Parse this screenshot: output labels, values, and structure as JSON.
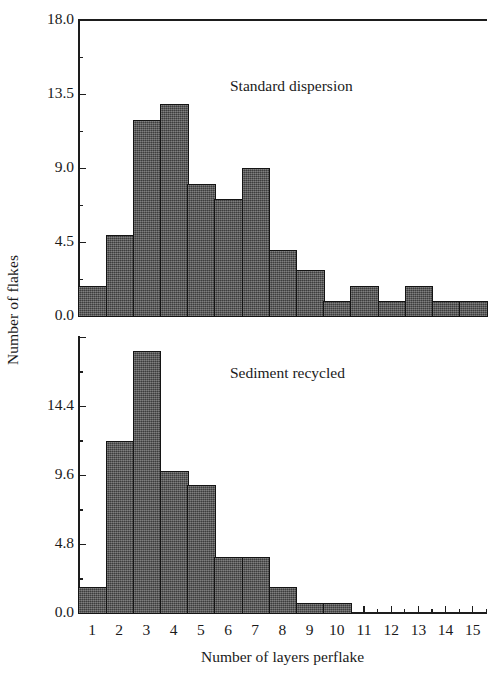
{
  "figure": {
    "axis_y_title": "Number of flakes",
    "axis_x_title": "Number of layers perflake",
    "bar_color": "#4d4d4d",
    "bar_edge_color": "#141414",
    "axis_color": "#1d1d1d"
  },
  "panels": [
    {
      "id": "top",
      "note": "Standard dispersion",
      "y_ticks_major": [
        "0.0",
        "4.5",
        "9.0",
        "13.5",
        "18.0"
      ]
    },
    {
      "id": "bottom",
      "note": "Sediment recycled",
      "y_ticks_major": [
        "0.0",
        "4.8",
        "9.6",
        "14.4"
      ]
    }
  ],
  "x_tick_labels": [
    "1",
    "2",
    "3",
    "4",
    "5",
    "6",
    "7",
    "8",
    "9",
    "10",
    "11",
    "12",
    "13",
    "14",
    "15"
  ],
  "chart_data": [
    {
      "type": "bar",
      "id": "standard-dispersion",
      "title": "Standard dispersion",
      "xlabel": "Number of layers perflake",
      "ylabel": "Number of flakes",
      "categories": [
        1,
        2,
        3,
        4,
        5,
        6,
        7,
        8,
        9,
        10,
        11,
        12,
        13,
        14,
        15
      ],
      "values": [
        1.8,
        4.9,
        11.9,
        12.9,
        8.0,
        7.1,
        9.0,
        4.0,
        2.8,
        0.9,
        1.8,
        0.9,
        1.8,
        0.9,
        0.9
      ],
      "ylim": [
        0,
        18.0
      ],
      "ytick_values": [
        0.0,
        2.25,
        4.5,
        6.75,
        9.0,
        11.25,
        13.5,
        15.75,
        18.0
      ],
      "ytick_labels_major": [
        "0.0",
        "4.5",
        "9.0",
        "13.5",
        "18.0"
      ],
      "grid": false,
      "legend": "none"
    },
    {
      "type": "bar",
      "id": "sediment-recycled",
      "title": "Sediment recycled",
      "xlabel": "Number of layers perflake",
      "ylabel": "Number of flakes",
      "categories": [
        1,
        2,
        3,
        4,
        5,
        6,
        7,
        8,
        9,
        10,
        11,
        12,
        13,
        14,
        15
      ],
      "values": [
        1.8,
        12.0,
        18.2,
        9.9,
        8.9,
        3.9,
        3.9,
        1.8,
        0.7,
        0.7,
        0,
        0,
        0,
        0,
        0
      ],
      "ylim": [
        0,
        19.2
      ],
      "ytick_values": [
        0.0,
        2.4,
        4.8,
        7.2,
        9.6,
        12.0,
        14.4,
        16.8,
        19.2
      ],
      "ytick_labels_major": [
        "0.0",
        "4.8",
        "9.6",
        "14.4"
      ],
      "grid": false,
      "legend": "none"
    }
  ]
}
